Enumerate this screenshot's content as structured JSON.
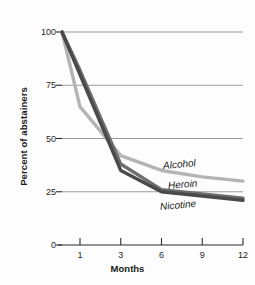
{
  "chart_data": {
    "type": "line",
    "title": "",
    "xlabel": "Months",
    "ylabel": "Percent of abstainers",
    "categories": [
      "1",
      "3",
      "6",
      "9",
      "12"
    ],
    "x_tick_labels": [
      "1",
      "3",
      "6",
      "9",
      "12"
    ],
    "y_tick_labels": [
      "0",
      "25",
      "50",
      "75",
      "100"
    ],
    "ylim": [
      0,
      100
    ],
    "yticks": [
      0,
      25,
      50,
      75,
      100
    ],
    "grid": "horizontal",
    "gridlines_at": [
      25,
      50,
      75,
      100
    ],
    "legend_position": "inline-labels",
    "note": "All series begin at 100 percent at time zero, just left of the month-1 tick.",
    "series": [
      {
        "name": "Alcohol",
        "color": "#b4b4b4",
        "start_value": 100,
        "values": [
          65,
          42,
          35,
          32,
          30
        ]
      },
      {
        "name": "Heroin",
        "color": "#6e6e6e",
        "start_value": 100,
        "values": [
          82,
          38,
          26,
          24,
          22
        ]
      },
      {
        "name": "Nicotine",
        "color": "#4a4a4a",
        "start_value": 100,
        "values": [
          80,
          35,
          25,
          23,
          21
        ]
      }
    ]
  },
  "axis": {
    "y_title": "Percent of abstainers",
    "x_title": "Months"
  },
  "labels": {
    "alcohol": "Alcohol",
    "heroin": "Heroin",
    "nicotine": "Nicotine"
  },
  "colors": {
    "alcohol": "#b4b4b4",
    "heroin": "#6e6e6e",
    "nicotine": "#4a4a4a",
    "gridline": "#8f8f8f",
    "axis": "#2b2b2b",
    "text": "#1a1a1a",
    "background": "#fdfdfd"
  }
}
